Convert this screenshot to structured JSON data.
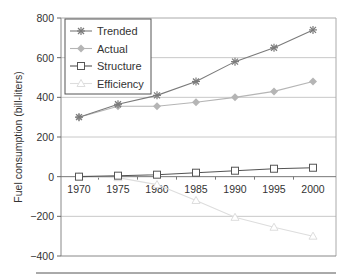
{
  "chart_data": {
    "type": "line",
    "title": "",
    "xlabel": "",
    "ylabel": "Fuel consumption (bill-liters)",
    "x": [
      1970,
      1975,
      1980,
      1985,
      1990,
      1995,
      2000
    ],
    "ylim": [
      -400,
      800
    ],
    "yticks": [
      -400,
      -200,
      0,
      200,
      400,
      600,
      800
    ],
    "grid": true,
    "legend_position": "upper left",
    "series": [
      {
        "name": "Trended",
        "marker": "asterisk",
        "color": "#7a7a7a",
        "values": [
          300,
          365,
          410,
          480,
          580,
          650,
          740
        ]
      },
      {
        "name": "Actual",
        "marker": "diamond",
        "color": "#b5b5b5",
        "values": [
          300,
          355,
          355,
          375,
          400,
          430,
          480
        ]
      },
      {
        "name": "Structure",
        "marker": "square-open",
        "color": "#555555",
        "values": [
          0,
          5,
          10,
          20,
          30,
          40,
          45
        ]
      },
      {
        "name": "Efficiency",
        "marker": "triangle-open",
        "color": "#dddddd",
        "values": [
          0,
          -5,
          -40,
          -120,
          -205,
          -255,
          -300
        ]
      }
    ]
  }
}
